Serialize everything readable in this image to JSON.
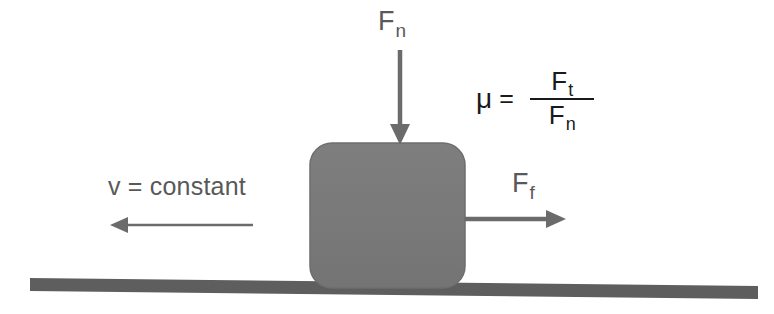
{
  "diagram": {
    "canvas": {
      "width": 774,
      "height": 314,
      "background": "#ffffff"
    },
    "colors": {
      "block_fill": "#7a7a7a",
      "block_stroke": "#6e6e6e",
      "ground": "#5e5e5e",
      "arrow": "#6b6b6b",
      "label_gray": "#595959",
      "formula_dark": "#1a1a1a"
    },
    "block": {
      "name": "block",
      "x": 310,
      "y": 143,
      "width": 155,
      "height": 145,
      "corner_radius": 22
    },
    "ground": {
      "name": "ground-surface",
      "x1": 30,
      "y1": 284,
      "x2": 758,
      "y2": 292,
      "thickness": 13
    },
    "forces": [
      {
        "id": "normal",
        "symbol": "F",
        "subscript": "n",
        "direction": "down",
        "arrow": {
          "x1": 400,
          "y1": 50,
          "x2": 400,
          "y2": 143
        }
      },
      {
        "id": "friction",
        "symbol": "F",
        "subscript": "f",
        "direction": "right",
        "arrow": {
          "x1": 465,
          "y1": 219,
          "x2": 566,
          "y2": 219
        }
      }
    ],
    "velocity": {
      "id": "velocity",
      "label": "v = constant",
      "direction": "left",
      "arrow": {
        "x1": 253,
        "y1": 225,
        "x2": 110,
        "y2": 225
      }
    },
    "formula": {
      "id": "friction-coefficient",
      "mu": "μ",
      "equals": "=",
      "numerator": {
        "symbol": "F",
        "subscript": "t"
      },
      "denominator": {
        "symbol": "F",
        "subscript": "n"
      },
      "plain_text": "μ = F_t / F_n"
    }
  }
}
